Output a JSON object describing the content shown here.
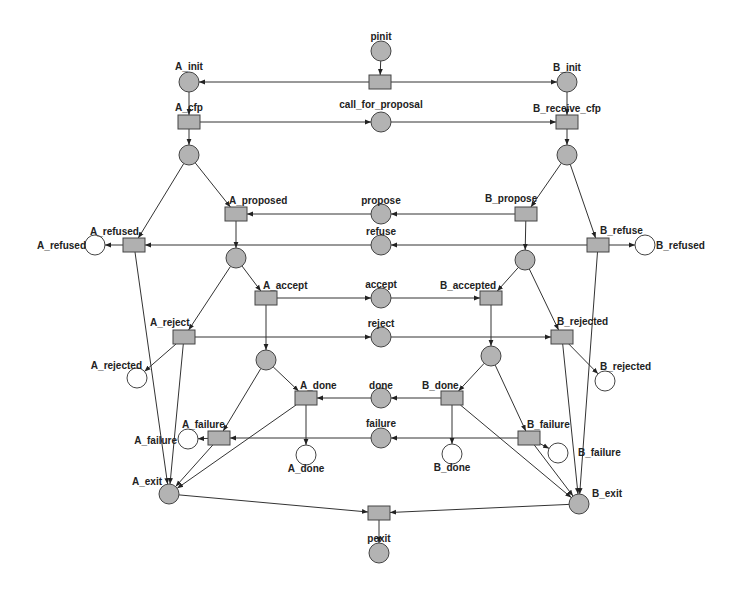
{
  "diagram": {
    "type": "petri-net",
    "colors": {
      "place_fill": "#b3b3b3",
      "empty_place_fill": "#ffffff",
      "transition_fill": "#b0b0b0",
      "stroke": "#444444",
      "arc": "#333333",
      "label": "#222222"
    },
    "places": [
      {
        "id": "pinit",
        "label": "pinit",
        "x": 381,
        "y": 51,
        "filled": true,
        "lx": 381,
        "ly": 40,
        "anchor": "middle"
      },
      {
        "id": "A_init",
        "label": "A_init",
        "x": 189,
        "y": 82,
        "filled": true,
        "lx": 189,
        "ly": 70,
        "anchor": "middle"
      },
      {
        "id": "B_init",
        "label": "B_init",
        "x": 567,
        "y": 82,
        "filled": true,
        "lx": 567,
        "ly": 71,
        "anchor": "middle"
      },
      {
        "id": "call_for_proposal",
        "label": "call_for_proposal",
        "x": 381,
        "y": 122,
        "filled": true,
        "lx": 381,
        "ly": 108,
        "anchor": "middle"
      },
      {
        "id": "A_p1",
        "label": "",
        "x": 189,
        "y": 155,
        "filled": true
      },
      {
        "id": "B_p1",
        "label": "",
        "x": 567,
        "y": 155,
        "filled": true
      },
      {
        "id": "propose",
        "label": "propose",
        "x": 381,
        "y": 214,
        "filled": true,
        "lx": 381,
        "ly": 204,
        "anchor": "middle"
      },
      {
        "id": "refuse",
        "label": "refuse",
        "x": 381,
        "y": 245,
        "filled": true,
        "lx": 381,
        "ly": 235,
        "anchor": "middle"
      },
      {
        "id": "A_refused_out",
        "label": "A_refused",
        "x": 95,
        "y": 245,
        "filled": false,
        "lx": 86,
        "ly": 249,
        "anchor": "end"
      },
      {
        "id": "B_refused_out",
        "label": "B_refused",
        "x": 645,
        "y": 245,
        "filled": false,
        "lx": 656,
        "ly": 249,
        "anchor": "start"
      },
      {
        "id": "A_p2",
        "label": "",
        "x": 236,
        "y": 258,
        "filled": true
      },
      {
        "id": "B_p2",
        "label": "",
        "x": 525,
        "y": 260,
        "filled": true
      },
      {
        "id": "accept",
        "label": "accept",
        "x": 381,
        "y": 298,
        "filled": true,
        "lx": 381,
        "ly": 288,
        "anchor": "middle"
      },
      {
        "id": "reject",
        "label": "reject",
        "x": 381,
        "y": 337,
        "filled": true,
        "lx": 381,
        "ly": 327,
        "anchor": "middle"
      },
      {
        "id": "A_rejected_out",
        "label": "A_rejected",
        "x": 137,
        "y": 378,
        "filled": false,
        "lx": 142,
        "ly": 369,
        "anchor": "end"
      },
      {
        "id": "B_rejected_out",
        "label": "B_rejected",
        "x": 605,
        "y": 381,
        "filled": false,
        "lx": 600,
        "ly": 370,
        "anchor": "start"
      },
      {
        "id": "A_p3",
        "label": "",
        "x": 266,
        "y": 360,
        "filled": true
      },
      {
        "id": "B_p3",
        "label": "",
        "x": 491,
        "y": 356,
        "filled": true
      },
      {
        "id": "done",
        "label": "done",
        "x": 381,
        "y": 398,
        "filled": true,
        "lx": 381,
        "ly": 389,
        "anchor": "middle"
      },
      {
        "id": "failure",
        "label": "failure",
        "x": 381,
        "y": 438,
        "filled": true,
        "lx": 381,
        "ly": 427,
        "anchor": "middle"
      },
      {
        "id": "A_failure_out",
        "label": "A_failure",
        "x": 188,
        "y": 439,
        "filled": false,
        "lx": 177,
        "ly": 444,
        "anchor": "end"
      },
      {
        "id": "A_done_out",
        "label": "A_done",
        "x": 306,
        "y": 455,
        "filled": false,
        "lx": 306,
        "ly": 472,
        "anchor": "middle"
      },
      {
        "id": "B_done_out",
        "label": "B_done",
        "x": 452,
        "y": 454,
        "filled": false,
        "lx": 452,
        "ly": 471,
        "anchor": "middle"
      },
      {
        "id": "B_failure_out",
        "label": "B_failure",
        "x": 558,
        "y": 453,
        "filled": false,
        "lx": 578,
        "ly": 456,
        "anchor": "start"
      },
      {
        "id": "A_exit",
        "label": "A_exit",
        "x": 169,
        "y": 494,
        "filled": true,
        "lx": 162,
        "ly": 485,
        "anchor": "end"
      },
      {
        "id": "B_exit",
        "label": "B_exit",
        "x": 579,
        "y": 504,
        "filled": true,
        "lx": 592,
        "ly": 497,
        "anchor": "start"
      },
      {
        "id": "pexit",
        "label": "pexit",
        "x": 379,
        "y": 553,
        "filled": true,
        "lx": 379,
        "ly": 542,
        "anchor": "middle"
      }
    ],
    "transitions": [
      {
        "id": "init",
        "label": "",
        "x": 380,
        "y": 82
      },
      {
        "id": "A_cfp",
        "label": "A_cfp",
        "x": 189,
        "y": 122,
        "lx": 189,
        "ly": 111,
        "anchor": "middle"
      },
      {
        "id": "B_receive_cfp",
        "label": "B_receive_cfp",
        "x": 567,
        "y": 122,
        "lx": 567,
        "ly": 112,
        "anchor": "middle"
      },
      {
        "id": "A_proposed",
        "label": "A_proposed",
        "x": 236,
        "y": 214,
        "lx": 229,
        "ly": 204,
        "anchor": "start"
      },
      {
        "id": "B_propose",
        "label": "B_propose",
        "x": 526,
        "y": 214,
        "lx": 485,
        "ly": 202,
        "anchor": "start"
      },
      {
        "id": "A_refused",
        "label": "A_refused",
        "x": 134,
        "y": 245,
        "lx": 90,
        "ly": 235,
        "anchor": "start"
      },
      {
        "id": "B_refuse",
        "label": "B_refuse",
        "x": 598,
        "y": 245,
        "lx": 600,
        "ly": 234,
        "anchor": "start"
      },
      {
        "id": "A_accept",
        "label": "A_accept",
        "x": 266,
        "y": 298,
        "lx": 263,
        "ly": 289,
        "anchor": "start"
      },
      {
        "id": "B_accepted",
        "label": "B_accepted",
        "x": 491,
        "y": 298,
        "lx": 440,
        "ly": 289,
        "anchor": "start"
      },
      {
        "id": "A_reject",
        "label": "A_reject",
        "x": 184,
        "y": 337,
        "lx": 150,
        "ly": 326,
        "anchor": "start"
      },
      {
        "id": "B_rejected",
        "label": "B_rejected",
        "x": 562,
        "y": 337,
        "lx": 557,
        "ly": 325,
        "anchor": "start"
      },
      {
        "id": "A_done",
        "label": "A_done",
        "x": 306,
        "y": 398,
        "lx": 300,
        "ly": 389,
        "anchor": "start"
      },
      {
        "id": "B_done",
        "label": "B_done",
        "x": 452,
        "y": 398,
        "lx": 422,
        "ly": 389,
        "anchor": "start"
      },
      {
        "id": "A_failure",
        "label": "A_failure",
        "x": 219,
        "y": 438,
        "lx": 182,
        "ly": 428,
        "anchor": "start"
      },
      {
        "id": "B_failure",
        "label": "B_failure",
        "x": 529,
        "y": 438,
        "lx": 527,
        "ly": 428,
        "anchor": "start"
      },
      {
        "id": "exit",
        "label": "",
        "x": 379,
        "y": 513
      }
    ],
    "arcs": [
      [
        "pinit",
        "init"
      ],
      [
        "init",
        "A_init"
      ],
      [
        "init",
        "B_init"
      ],
      [
        "A_init",
        "A_cfp"
      ],
      [
        "B_init",
        "B_receive_cfp"
      ],
      [
        "A_cfp",
        "call_for_proposal"
      ],
      [
        "call_for_proposal",
        "B_receive_cfp"
      ],
      [
        "A_cfp",
        "A_p1"
      ],
      [
        "B_receive_cfp",
        "B_p1"
      ],
      [
        "A_p1",
        "A_proposed"
      ],
      [
        "A_p1",
        "A_refused"
      ],
      [
        "B_p1",
        "B_propose"
      ],
      [
        "B_p1",
        "B_refuse"
      ],
      [
        "B_propose",
        "propose"
      ],
      [
        "propose",
        "A_proposed"
      ],
      [
        "B_refuse",
        "refuse"
      ],
      [
        "refuse",
        "A_refused"
      ],
      [
        "A_refused",
        "A_refused_out"
      ],
      [
        "B_refuse",
        "B_refused_out"
      ],
      [
        "A_proposed",
        "A_p2"
      ],
      [
        "B_propose",
        "B_p2"
      ],
      [
        "A_p2",
        "A_accept"
      ],
      [
        "A_p2",
        "A_reject"
      ],
      [
        "B_p2",
        "B_accepted"
      ],
      [
        "B_p2",
        "B_rejected"
      ],
      [
        "A_accept",
        "accept"
      ],
      [
        "accept",
        "B_accepted"
      ],
      [
        "A_reject",
        "reject"
      ],
      [
        "reject",
        "B_rejected"
      ],
      [
        "A_reject",
        "A_rejected_out"
      ],
      [
        "B_rejected",
        "B_rejected_out"
      ],
      [
        "A_accept",
        "A_p3"
      ],
      [
        "B_accepted",
        "B_p3"
      ],
      [
        "A_p3",
        "A_done"
      ],
      [
        "A_p3",
        "A_failure"
      ],
      [
        "B_p3",
        "B_done"
      ],
      [
        "B_p3",
        "B_failure"
      ],
      [
        "B_done",
        "done"
      ],
      [
        "done",
        "A_done"
      ],
      [
        "B_failure",
        "failure"
      ],
      [
        "failure",
        "A_failure"
      ],
      [
        "A_done",
        "A_done_out"
      ],
      [
        "A_failure",
        "A_failure_out"
      ],
      [
        "B_done",
        "B_done_out"
      ],
      [
        "B_failure",
        "B_failure_out"
      ],
      [
        "A_refused",
        "A_exit"
      ],
      [
        "A_reject",
        "A_exit"
      ],
      [
        "A_done",
        "A_exit"
      ],
      [
        "A_failure",
        "A_exit"
      ],
      [
        "B_refuse",
        "B_exit"
      ],
      [
        "B_rejected",
        "B_exit"
      ],
      [
        "B_done",
        "B_exit"
      ],
      [
        "B_failure",
        "B_exit"
      ],
      [
        "A_exit",
        "exit"
      ],
      [
        "B_exit",
        "exit"
      ],
      [
        "exit",
        "pexit"
      ]
    ]
  }
}
